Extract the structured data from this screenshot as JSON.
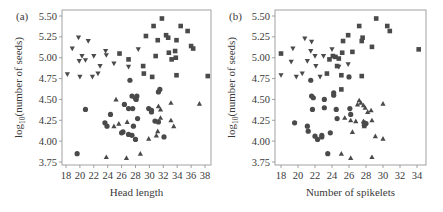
{
  "chart_data": [
    {
      "panel_label": "(a)",
      "type": "scatter",
      "title": "",
      "xlabel": "Head length",
      "ylabel": "log10(number of seeds)",
      "ylabel_main": "log",
      "ylabel_sub": "10",
      "ylabel_rest": "(number of seeds)",
      "xlim": [
        17.5,
        39
      ],
      "ylim": [
        3.72,
        5.55
      ],
      "xticks": [
        18,
        20,
        22,
        24,
        26,
        28,
        30,
        32,
        34,
        36,
        38
      ],
      "yticks": [
        3.75,
        4.0,
        4.25,
        4.5,
        4.75,
        5.0,
        5.25,
        5.5
      ],
      "ytick_labels": [
        "3.75",
        "4.00",
        "4.25",
        "4.50",
        "4.75",
        "5.00",
        "5.25",
        "5.50"
      ],
      "grid": false,
      "series": [
        {
          "name": "triangle-down",
          "marker": "triangle-down",
          "points": [
            [
              19.8,
              5.24
            ],
            [
              18.9,
              5.11
            ],
            [
              21.2,
              5.2
            ],
            [
              23.7,
              5.08
            ],
            [
              19.9,
              4.96
            ],
            [
              20.3,
              5.02
            ],
            [
              20.8,
              4.97
            ],
            [
              22.0,
              5.02
            ],
            [
              22.9,
              4.9
            ],
            [
              23.8,
              5.03
            ],
            [
              24.9,
              4.93
            ],
            [
              22.6,
              4.81
            ],
            [
              21.8,
              4.77
            ],
            [
              20.0,
              4.77
            ],
            [
              18.2,
              4.8
            ],
            [
              27.0,
              4.89
            ],
            [
              28.4,
              5.1
            ]
          ]
        },
        {
          "name": "square",
          "marker": "square",
          "points": [
            [
              31.8,
              5.47
            ],
            [
              30.6,
              5.38
            ],
            [
              34.5,
              5.38
            ],
            [
              35.5,
              5.32
            ],
            [
              29.5,
              5.26
            ],
            [
              32.4,
              5.27
            ],
            [
              32.7,
              5.24
            ],
            [
              31.2,
              5.21
            ],
            [
              33.9,
              5.21
            ],
            [
              36.0,
              5.14
            ],
            [
              36.3,
              5.11
            ],
            [
              32.8,
              5.06
            ],
            [
              33.7,
              5.08
            ],
            [
              30.9,
              5.02
            ],
            [
              33.2,
              4.98
            ],
            [
              33.8,
              5.0
            ],
            [
              25.7,
              5.05
            ],
            [
              27.0,
              4.98
            ],
            [
              29.1,
              4.9
            ],
            [
              29.2,
              4.81
            ],
            [
              33.9,
              4.79
            ],
            [
              38.4,
              4.78
            ],
            [
              30.4,
              4.77
            ]
          ]
        },
        {
          "name": "circle",
          "marker": "circle",
          "points": [
            [
              27.2,
              4.73
            ],
            [
              31.5,
              4.62
            ],
            [
              31.3,
              4.59
            ],
            [
              27.5,
              4.54
            ],
            [
              28.2,
              4.54
            ],
            [
              28.0,
              4.51
            ],
            [
              28.1,
              4.5
            ],
            [
              20.8,
              4.38
            ],
            [
              26.4,
              4.44
            ],
            [
              27.0,
              4.39
            ],
            [
              27.6,
              4.39
            ],
            [
              29.9,
              4.39
            ],
            [
              30.3,
              4.37
            ],
            [
              30.3,
              4.35
            ],
            [
              24.4,
              4.32
            ],
            [
              28.3,
              4.27
            ],
            [
              23.6,
              4.22
            ],
            [
              23.9,
              4.18
            ],
            [
              27.7,
              4.18
            ],
            [
              30.8,
              4.24
            ],
            [
              31.3,
              4.23
            ],
            [
              26.2,
              4.11
            ],
            [
              26.0,
              4.1
            ],
            [
              27.0,
              4.08
            ],
            [
              27.5,
              4.07
            ],
            [
              28.0,
              4.02
            ],
            [
              32.1,
              4.05
            ],
            [
              19.6,
              3.85
            ]
          ]
        },
        {
          "name": "triangle-up",
          "marker": "triangle-up",
          "points": [
            [
              25.2,
              4.5
            ],
            [
              31.3,
              4.42
            ],
            [
              31.6,
              4.38
            ],
            [
              33.1,
              4.46
            ],
            [
              37.2,
              4.45
            ],
            [
              26.8,
              4.23
            ],
            [
              25.6,
              4.21
            ],
            [
              24.9,
              4.18
            ],
            [
              31.6,
              4.28
            ],
            [
              33.1,
              4.25
            ],
            [
              33.5,
              4.18
            ],
            [
              31.2,
              4.12
            ],
            [
              31.0,
              4.07
            ],
            [
              29.9,
              4.03
            ],
            [
              23.8,
              3.81
            ],
            [
              26.7,
              3.8
            ],
            [
              28.7,
              3.85
            ]
          ]
        }
      ]
    },
    {
      "panel_label": "(b)",
      "type": "scatter",
      "title": "",
      "xlabel": "Number of spikelets",
      "ylabel": "log10(number of seeds)",
      "ylabel_main": "log",
      "ylabel_sub": "10",
      "ylabel_rest": "(number of seeds)",
      "xlim": [
        17.3,
        35
      ],
      "ylim": [
        3.72,
        5.55
      ],
      "xticks": [
        18,
        20,
        22,
        24,
        26,
        28,
        30,
        32,
        34
      ],
      "yticks": [
        3.75,
        4.0,
        4.25,
        4.5,
        4.75,
        5.0,
        5.25,
        5.5
      ],
      "ytick_labels": [
        "3.75",
        "4.00",
        "4.25",
        "4.50",
        "4.75",
        "5.00",
        "5.25",
        "5.50"
      ],
      "grid": false,
      "series": [
        {
          "name": "triangle-down",
          "marker": "triangle-down",
          "points": [
            [
              20.8,
              5.23
            ],
            [
              21.6,
              5.19
            ],
            [
              19.4,
              5.11
            ],
            [
              21.5,
              5.08
            ],
            [
              24.0,
              5.1
            ],
            [
              19.2,
              4.95
            ],
            [
              21.1,
              4.96
            ],
            [
              22.0,
              5.02
            ],
            [
              23.0,
              5.02
            ],
            [
              25.9,
              4.92
            ],
            [
              22.1,
              4.9
            ],
            [
              24.8,
              4.89
            ],
            [
              18.0,
              4.79
            ],
            [
              19.8,
              4.77
            ],
            [
              20.5,
              4.81
            ],
            [
              22.6,
              4.77
            ]
          ]
        },
        {
          "name": "square",
          "marker": "square",
          "points": [
            [
              29.2,
              5.47
            ],
            [
              27.2,
              5.38
            ],
            [
              30.5,
              5.38
            ],
            [
              30.8,
              5.32
            ],
            [
              25.9,
              5.27
            ],
            [
              27.6,
              5.24
            ],
            [
              27.5,
              5.2
            ],
            [
              25.3,
              5.2
            ],
            [
              28.7,
              5.13
            ],
            [
              34.2,
              5.1
            ],
            [
              18.0,
              5.05
            ],
            [
              25.2,
              5.06
            ],
            [
              26.4,
              5.07
            ],
            [
              24.1,
              5.02
            ],
            [
              24.4,
              5.01
            ],
            [
              24.8,
              4.99
            ],
            [
              23.7,
              4.98
            ],
            [
              24.6,
              4.9
            ],
            [
              23.4,
              4.81
            ],
            [
              25.1,
              4.79
            ],
            [
              27.5,
              4.78
            ],
            [
              25.1,
              4.62
            ]
          ]
        },
        {
          "name": "circle",
          "marker": "circle",
          "points": [
            [
              21.5,
              4.73
            ],
            [
              26.0,
              4.77
            ],
            [
              24.2,
              4.58
            ],
            [
              24.2,
              4.55
            ],
            [
              21.6,
              4.54
            ],
            [
              21.8,
              4.52
            ],
            [
              23.1,
              4.5
            ],
            [
              21.7,
              4.38
            ],
            [
              23.1,
              4.4
            ],
            [
              24.5,
              4.38
            ],
            [
              26.1,
              4.39
            ],
            [
              26.2,
              4.32
            ],
            [
              24.6,
              4.27
            ],
            [
              19.6,
              4.22
            ],
            [
              21.1,
              4.18
            ],
            [
              21.2,
              4.12
            ],
            [
              23.8,
              4.1
            ],
            [
              22.0,
              4.06
            ],
            [
              22.3,
              4.02
            ],
            [
              22.8,
              4.05
            ],
            [
              22.8,
              4.07
            ],
            [
              27.8,
              4.22
            ],
            [
              27.8,
              4.19
            ],
            [
              28.0,
              4.21
            ],
            [
              23.5,
              3.85
            ]
          ]
        },
        {
          "name": "triangle-up",
          "marker": "triangle-up",
          "points": [
            [
              27.2,
              4.49
            ],
            [
              27.4,
              4.46
            ],
            [
              27.0,
              4.44
            ],
            [
              27.7,
              4.43
            ],
            [
              27.9,
              4.4
            ],
            [
              28.6,
              4.37
            ],
            [
              30.0,
              4.45
            ],
            [
              28.2,
              4.35
            ],
            [
              25.5,
              4.28
            ],
            [
              26.2,
              4.25
            ],
            [
              26.8,
              4.24
            ],
            [
              27.7,
              4.24
            ],
            [
              28.7,
              4.25
            ],
            [
              27.8,
              4.18
            ],
            [
              26.4,
              4.11
            ],
            [
              29.1,
              4.06
            ],
            [
              30.0,
              4.03
            ],
            [
              25.1,
              3.85
            ],
            [
              26.2,
              3.8
            ],
            [
              28.7,
              3.81
            ]
          ]
        }
      ]
    }
  ],
  "colors": {
    "marker": "#4a4a4a",
    "axis": "#8a8a8a",
    "text": "#3a3a3a",
    "background": "#ffffff"
  }
}
